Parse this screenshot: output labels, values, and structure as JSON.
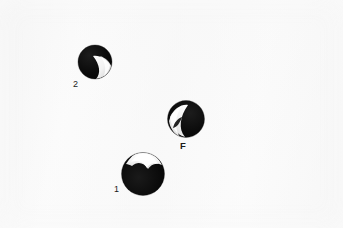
{
  "figure": {
    "background_color": "#fbfbfb",
    "body_color": "#ffffff",
    "width": 343,
    "height": 228,
    "specimen_fill": "#0a0a0a",
    "notch_fill": "#fdfdfd",
    "label_color": "#1b1b1b"
  },
  "specimens": [
    {
      "id": "specimen-2",
      "label": "2",
      "label_bold": false,
      "notch_position": "right",
      "center_x": 95,
      "center_y": 62,
      "radius": 17,
      "label_x": 73,
      "label_y": 84
    },
    {
      "id": "specimen-f",
      "label": "F",
      "label_bold": true,
      "notch_position": "left",
      "center_x": 186,
      "center_y": 119,
      "radius": 19,
      "label_x": 180,
      "label_y": 145
    },
    {
      "id": "specimen-1",
      "label": "1",
      "label_bold": false,
      "notch_position": "top",
      "center_x": 143,
      "center_y": 175,
      "radius": 22,
      "label_x": 114,
      "label_y": 190
    }
  ]
}
